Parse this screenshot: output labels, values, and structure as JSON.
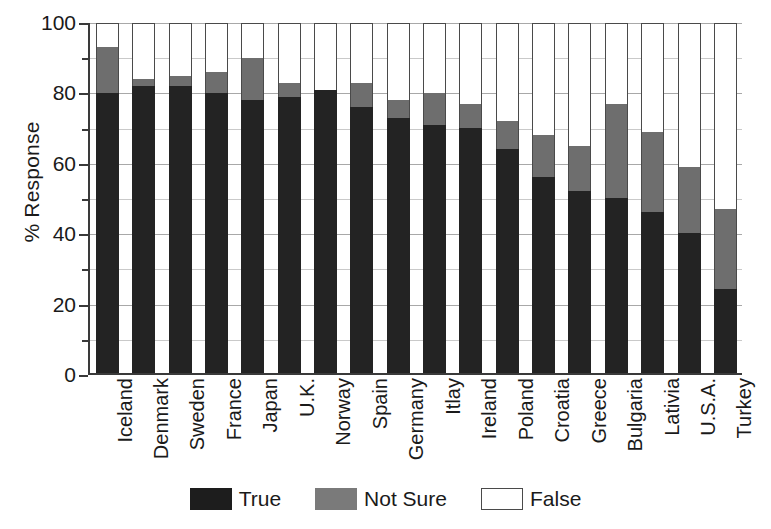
{
  "chart_data": {
    "type": "bar",
    "stacked": true,
    "title": "",
    "xlabel": "",
    "ylabel": "% Response",
    "ylim": [
      0,
      100
    ],
    "yticks": [
      0,
      20,
      40,
      60,
      80,
      100
    ],
    "grid": true,
    "legend_position": "bottom",
    "categories": [
      "Iceland",
      "Denmark",
      "Sweden",
      "France",
      "Japan",
      "U.K.",
      "Norway",
      "Spain",
      "Germany",
      "Itlay",
      "Ireland",
      "Poland",
      "Croatia",
      "Greece",
      "Bulgaria",
      "Lativia",
      "U.S.A.",
      "Turkey"
    ],
    "series": [
      {
        "name": "True",
        "color": "#232323",
        "values": [
          80,
          82,
          82,
          80,
          78,
          79,
          81,
          76,
          73,
          71,
          70,
          64,
          56,
          52,
          50,
          46,
          40,
          24
        ]
      },
      {
        "name": "Not Sure",
        "color": "#6e6e6e",
        "values": [
          13,
          2,
          3,
          6,
          12,
          4,
          0,
          7,
          5,
          9,
          7,
          8,
          12,
          13,
          27,
          23,
          19,
          23
        ]
      },
      {
        "name": "False",
        "color": "#ffffff",
        "values": [
          7,
          16,
          15,
          14,
          10,
          17,
          19,
          17,
          22,
          20,
          23,
          28,
          32,
          35,
          23,
          31,
          41,
          53
        ]
      }
    ],
    "cumulative_tops": {
      "true": [
        80,
        82,
        82,
        80,
        78,
        79,
        81,
        76,
        73,
        71,
        70,
        64,
        56,
        52,
        50,
        46,
        40,
        24
      ],
      "not_sure": [
        93,
        84,
        85,
        86,
        90,
        83,
        81,
        83,
        78,
        80,
        77,
        72,
        68,
        65,
        77,
        69,
        59,
        47
      ],
      "false": [
        100,
        100,
        100,
        100,
        100,
        100,
        100,
        100,
        100,
        100,
        100,
        100,
        100,
        100,
        100,
        100,
        100,
        100
      ]
    }
  },
  "axis": {
    "y_title": "% Response",
    "y_tick_labels": [
      "100",
      "80",
      "60",
      "40",
      "20",
      "0"
    ]
  },
  "legend": {
    "items": [
      {
        "label": "True",
        "color": "#232323"
      },
      {
        "label": "Not Sure",
        "color": "#6e6e6e"
      },
      {
        "label": "False",
        "color": "#ffffff"
      }
    ]
  }
}
